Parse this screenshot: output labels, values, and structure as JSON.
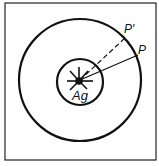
{
  "diagram": {
    "center_label": "Ag",
    "point_p": "P",
    "point_p_prime": "P′",
    "stroke_color": "#111111",
    "background": "#ffffff"
  }
}
